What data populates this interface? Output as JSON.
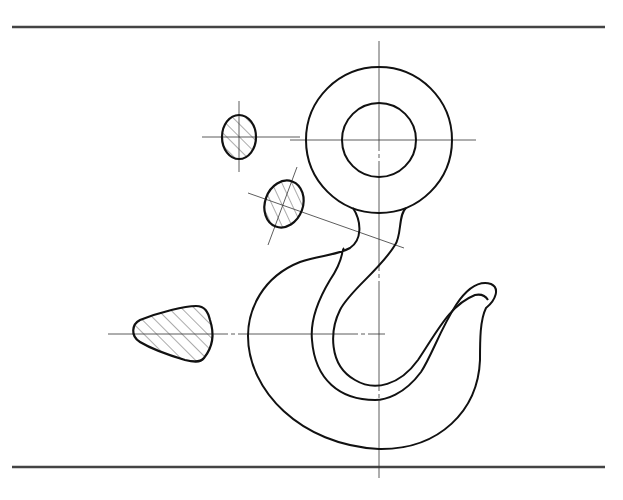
{
  "figure": {
    "colors": {
      "outline": "#111111",
      "centerline": "#333333",
      "hatch": "#444444",
      "border": "#444444",
      "background": "#ffffff"
    },
    "parts": [
      {
        "name": "eye-ring",
        "description": "Ring eye with concentric inner hole"
      },
      {
        "name": "hook-body",
        "description": "J-shaped hook body"
      },
      {
        "name": "section-shank",
        "description": "Hatched elliptical cross-section of shank"
      },
      {
        "name": "section-neck",
        "description": "Hatched inclined elliptical cross-section of neck"
      },
      {
        "name": "section-hook",
        "description": "Hatched trapezoidal cross-section of hook body"
      }
    ]
  }
}
